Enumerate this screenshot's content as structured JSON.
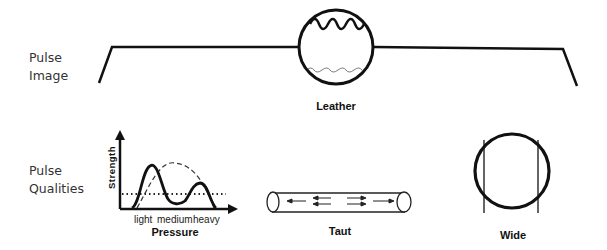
{
  "rows": {
    "pulse_image": {
      "label_line1": "Pulse",
      "label_line2": "Image"
    },
    "pulse_qualities": {
      "label_line1": "Pulse",
      "label_line2": "Qualities"
    }
  },
  "pulse_image": {
    "caption": "Leather",
    "elements": [
      "baseline-with-slanted-ends",
      "circle",
      "large-wave-top",
      "thin-wave-bottom"
    ]
  },
  "qualities": {
    "pressure_graph": {
      "y_axis_label": "Strength",
      "x_axis_label": "Pressure",
      "x_ticks": [
        "light",
        "medium",
        "heavy"
      ],
      "series": [
        {
          "name": "pulse-curve",
          "style": "solid",
          "shape": "tall peak at light, dip at medium, smaller peak at heavy"
        },
        {
          "name": "normal-curve",
          "style": "dashed",
          "shape": "single broad peak at medium"
        },
        {
          "name": "baseline",
          "style": "dotted",
          "shape": "horizontal reference line"
        }
      ]
    },
    "taut": {
      "caption": "Taut"
    },
    "wide": {
      "caption": "Wide"
    }
  }
}
